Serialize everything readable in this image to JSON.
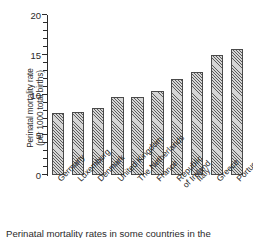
{
  "chart_data": {
    "type": "bar",
    "title": "",
    "xlabel": "",
    "ylabel": "Perinatal mortality rate (per 1000 total births)",
    "ylabel_line1": "Perinatal mortality rate",
    "ylabel_line2": "(per 1000 total births)",
    "categories": [
      "Germany",
      "Luxemburg",
      "Denmark",
      "United Kingdom",
      "The Netherlands",
      "France",
      "Republic of Ireland",
      "Italy",
      "Greece",
      "Portugal"
    ],
    "category_lines": [
      [
        "Germany"
      ],
      [
        "Luxemburg"
      ],
      [
        "Denmark"
      ],
      [
        "United Kingdom"
      ],
      [
        "The Netherlands"
      ],
      [
        "France"
      ],
      [
        "Republic",
        "of Ireland"
      ],
      [
        "Italy"
      ],
      [
        "Greece"
      ],
      [
        "Portugal"
      ]
    ],
    "values": [
      7.7,
      7.9,
      8.4,
      9.7,
      9.8,
      10.5,
      12.0,
      12.9,
      15.0,
      15.8
    ],
    "ylim": [
      0,
      20
    ],
    "ytick_major": [
      0,
      5,
      10,
      15,
      20
    ],
    "ytick_major_labels": [
      "0",
      "5",
      "10",
      "15",
      "20"
    ],
    "ytick_minor_step": 1,
    "grid": false,
    "legend": null,
    "bar_fill": "#d6d6d6",
    "bar_hatch": "diagonal-crosshatch",
    "bar_edge_color": "#4a4a4a",
    "axis_color": "#2b2b2b"
  },
  "caption": {
    "text": "Perinatal mortality rates in some countries in the"
  }
}
